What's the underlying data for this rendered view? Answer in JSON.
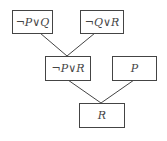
{
  "nodes": [
    {
      "id": "n1",
      "label": "¬P∨Q"
    },
    {
      "id": "n2",
      "label": "¬Q∨R"
    },
    {
      "id": "n3",
      "label": "¬P∨R"
    },
    {
      "id": "n4",
      "label": "P"
    },
    {
      "id": "n5",
      "label": "R"
    }
  ],
  "edges": [
    {
      "from": "n1",
      "to": "n3"
    },
    {
      "from": "n2",
      "to": "n3"
    },
    {
      "from": "n3",
      "to": "n5"
    },
    {
      "from": "n4",
      "to": "n5"
    }
  ],
  "colors": {
    "stroke": "#444444",
    "background": "#ffffff"
  }
}
